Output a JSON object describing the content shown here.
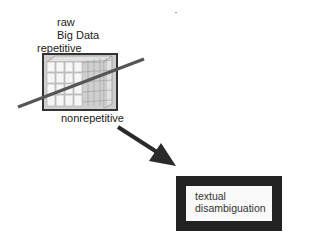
{
  "labels": {
    "raw": "raw",
    "big_data": "Big Data",
    "repetitive": "repetitive",
    "nonrepetitive": "nonrepetitive"
  },
  "target_box": {
    "line1": "textual",
    "line2": "disambiguation"
  },
  "colors": {
    "line": "#555555",
    "arrow": "#2a2a2a",
    "box_border": "#222222",
    "cube_fill": "#cfcfcf",
    "grid_cell": "#f4f4f4"
  }
}
